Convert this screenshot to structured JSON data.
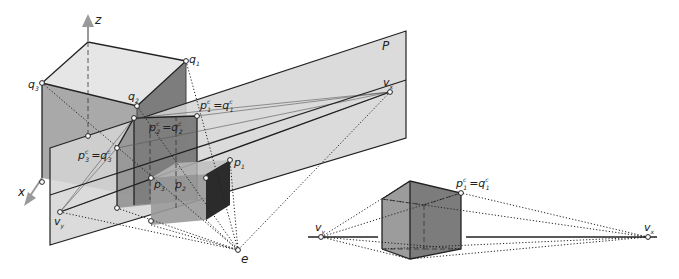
{
  "figure": {
    "left_panel": {
      "axes": {
        "z_label": "z",
        "x_label": "x"
      },
      "plane_label": "P",
      "object_points": {
        "q1": {
          "base": "q",
          "sub": "1"
        },
        "q2": {
          "base": "q",
          "sub": "2"
        },
        "q3": {
          "base": "q",
          "sub": "3"
        },
        "p1": {
          "base": "p",
          "sub": "1"
        },
        "p2": {
          "base": "p",
          "sub": "2"
        },
        "p3": {
          "base": "p",
          "sub": "3"
        }
      },
      "projected_points": {
        "p1c_q1c": {
          "lhs": "p",
          "lhs_sup": "c",
          "lhs_sub": "1",
          "eq": "=",
          "rhs": "q",
          "rhs_sup": "c",
          "rhs_sub": "1"
        },
        "p2c_q2c": {
          "lhs": "p",
          "lhs_sup": "c",
          "lhs_sub": "2",
          "eq": "=",
          "rhs": "q",
          "rhs_sup": "c",
          "rhs_sub": "2"
        },
        "p3c_q3c": {
          "lhs": "p",
          "lhs_sup": "c",
          "lhs_sub": "3",
          "eq": "=",
          "rhs": "q",
          "rhs_sup": "c",
          "rhs_sub": "3"
        }
      },
      "vanishing_points": {
        "vx": {
          "base": "v",
          "sub": "x"
        },
        "vy": {
          "base": "v",
          "sub": "y"
        }
      },
      "eye_label": "e"
    },
    "right_panel": {
      "vanishing_points": {
        "vx": {
          "base": "v",
          "sub": "x"
        },
        "vy": {
          "base": "v",
          "sub": "y"
        }
      },
      "projected_point": {
        "lhs": "p",
        "lhs_sup": "c",
        "lhs_sub": "1",
        "eq": "=",
        "rhs": "q",
        "rhs_sup": "c",
        "rhs_sub": "1"
      }
    },
    "colors": {
      "plane_fill": "#d6d6d6",
      "cube_top": "#e4e4e4",
      "cube_front": "#a8a8a8",
      "cube_side": "#7a7a7a",
      "small_cube_front": "#9a9a9a",
      "small_cube_side": "#2a2a2a",
      "projection_face": "#8f8f8f",
      "right_cube_front": "#9b9b9b",
      "right_cube_side": "#7c7c7c",
      "axis_arrow": "#9a9a9a"
    }
  }
}
